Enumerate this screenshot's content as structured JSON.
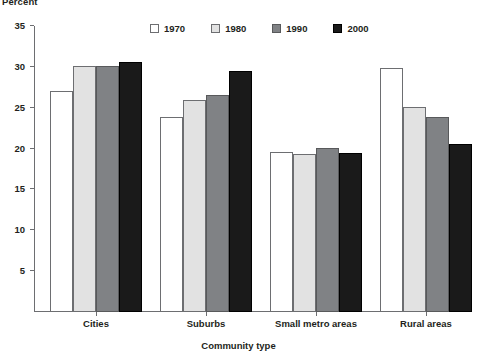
{
  "chart_data": {
    "type": "bar",
    "title": "",
    "ylabel": "Percent",
    "xlabel": "Community type",
    "categories": [
      "Cities",
      "Suburbs",
      "Small metro areas",
      "Rural areas"
    ],
    "series": [
      {
        "name": "1970",
        "color": "#ffffff",
        "values": [
          27.1,
          23.9,
          19.6,
          29.9
        ]
      },
      {
        "name": "1980",
        "color": "#e2e2e2",
        "values": [
          30.1,
          26.0,
          19.3,
          25.1
        ]
      },
      {
        "name": "1990",
        "color": "#808285",
        "values": [
          30.1,
          26.5,
          20.1,
          23.9
        ]
      },
      {
        "name": "2000",
        "color": "#1a1a1a",
        "values": [
          30.6,
          29.5,
          19.5,
          20.6
        ]
      }
    ],
    "ylim": [
      0,
      35
    ],
    "yticks": [
      5,
      10,
      15,
      20,
      25,
      30,
      35
    ],
    "ytick_labels": [
      "5",
      "10",
      "15",
      "20",
      "25",
      "30",
      "35"
    ],
    "grid": false,
    "legend_position": "top-center"
  }
}
